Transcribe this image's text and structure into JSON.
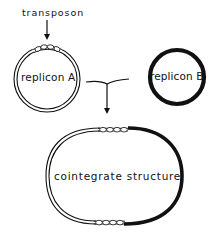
{
  "figure": {
    "labels": {
      "transposon": "transposon",
      "replicon_a": "replicon A",
      "replicon_b": "replicon B",
      "cointegrate": "cointegrate structure"
    },
    "elements": {
      "replicon_a": {
        "style": "double-line circle",
        "carries_transposon": true
      },
      "replicon_b": {
        "style": "thick solid circle",
        "carries_transposon": false
      },
      "cointegrate": {
        "style": "oval: left half double-line (from replicon A), right half thick solid (from replicon B)",
        "transposon_copies": 2
      }
    },
    "colors": {
      "ink": "#111111",
      "background": "#ffffff"
    }
  }
}
